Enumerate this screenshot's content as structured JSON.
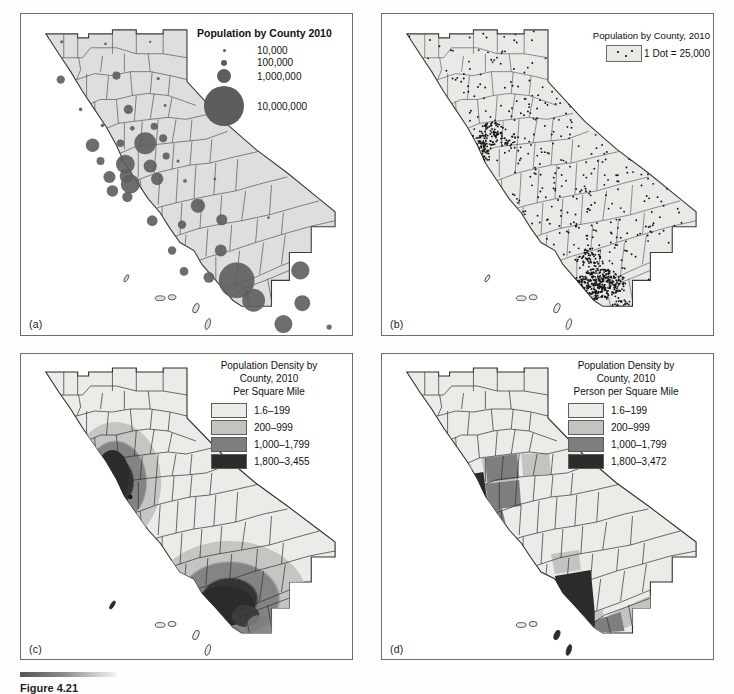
{
  "figure": {
    "caption_label": "Figure 4.21",
    "panels": [
      "(a)",
      "(b)",
      "(c)",
      "(d)"
    ]
  },
  "panel_a": {
    "label": "(a)",
    "legend": {
      "title": "Population by County 2010",
      "items": [
        {
          "value": "10,000",
          "size_px": 2
        },
        {
          "value": "100,000",
          "size_px": 5
        },
        {
          "value": "1,000,000",
          "size_px": 13
        },
        {
          "value": "10,000,000",
          "size_px": 34
        }
      ]
    },
    "symbol_color": "#5d5d5d",
    "land_color": "#dedede"
  },
  "panel_b": {
    "label": "(b)",
    "legend": {
      "title": "Population by County, 2010",
      "swatch_label": "1 Dot = 25,000"
    },
    "dot_value": 25000,
    "land_color": "#e9e9e6"
  },
  "panel_c": {
    "label": "(c)",
    "legend": {
      "title_line1": "Population Density by",
      "title_line2": "County, 2010",
      "title_line3": "Per Square Mile",
      "classes": [
        {
          "range": "1.6–199",
          "color": "#ebebe7"
        },
        {
          "range": "200–999",
          "color": "#c3c3bf"
        },
        {
          "range": "1,000–1,799",
          "color": "#7e7e7c"
        },
        {
          "range": "1,800–3,455",
          "color": "#2b2b2b"
        }
      ]
    }
  },
  "panel_d": {
    "label": "(d)",
    "legend": {
      "title_line1": "Population Density by",
      "title_line2": "County, 2010",
      "title_line3": "Person per Square Mile",
      "classes": [
        {
          "range": "1.6–199",
          "color": "#ebebe7"
        },
        {
          "range": "200–999",
          "color": "#c3c3bf"
        },
        {
          "range": "1,000–1,799",
          "color": "#7e7e7c"
        },
        {
          "range": "1,800–3,472",
          "color": "#2b2b2b"
        }
      ]
    }
  },
  "chart_data": {
    "type": "map",
    "subject_area": "California counties",
    "year": 2010,
    "maps": [
      {
        "panel": "(a)",
        "map_type": "proportional-symbol",
        "variable": "Population by county",
        "legend_title": "Population by County 2010",
        "legend_breaks": [
          10000,
          100000,
          1000000,
          10000000
        ],
        "legend_break_labels": [
          "10,000",
          "100,000",
          "1,000,000",
          "10,000,000"
        ],
        "symbol": "circle",
        "symbol_color": "#5d5d5d"
      },
      {
        "panel": "(b)",
        "map_type": "dot-density",
        "variable": "Population by county",
        "legend_title": "Population by County, 2010",
        "dot_value": 25000,
        "dot_value_label": "1 Dot = 25,000",
        "notes": "Dots cluster in the San Francisco Bay Area, Sacramento Valley and the Los Angeles / San Diego basins."
      },
      {
        "panel": "(c)",
        "map_type": "choropleth-smoothed",
        "variable": "Population density per square mile",
        "legend_title": "Population Density by County, 2010 Per Square Mile",
        "class_ranges": [
          "1.6–199",
          "200–999",
          "1,000–1,799",
          "1,800–3,455"
        ],
        "class_min": 1.6,
        "class_max": 3455,
        "class_colors": [
          "#ebebe7",
          "#c3c3bf",
          "#7e7e7c",
          "#2b2b2b"
        ],
        "notes": "Isopleth / dasymetric-style smoothing of density surface."
      },
      {
        "panel": "(d)",
        "map_type": "choropleth",
        "variable": "Population density per square mile",
        "legend_title": "Population Density by County, 2010 Person per Square Mile",
        "class_ranges": [
          "1.6–199",
          "200–999",
          "1,000–1,799",
          "1,800–3,472"
        ],
        "class_min": 1.6,
        "class_max": 3472,
        "class_colors": [
          "#ebebe7",
          "#c3c3bf",
          "#7e7e7c",
          "#2b2b2b"
        ],
        "notes": "Classed by county polygon boundaries."
      }
    ]
  }
}
